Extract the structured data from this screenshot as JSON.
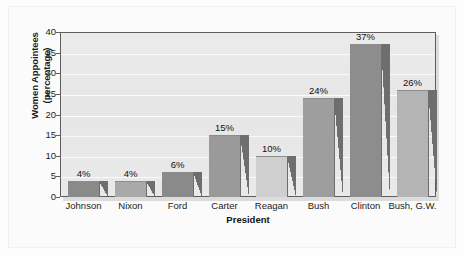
{
  "chart_data": {
    "type": "bar",
    "title": "",
    "xlabel": "President",
    "ylabel": "Women Appointees\n(percentage)",
    "ylabel_line1": "Women Appointees",
    "ylabel_line2": "(percentage)",
    "categories": [
      "Johnson",
      "Nixon",
      "Ford",
      "Carter",
      "Reagan",
      "Bush",
      "Clinton",
      "Bush, G.W."
    ],
    "values": [
      4,
      4,
      6,
      15,
      10,
      24,
      37,
      26
    ],
    "value_labels": [
      "4%",
      "4%",
      "6%",
      "15%",
      "10%",
      "24%",
      "37%",
      "26%"
    ],
    "bar_colors": [
      "#8a8a8a",
      "#a9a9a9",
      "#8a8a8a",
      "#9a9a9a",
      "#cfcfcf",
      "#9e9e9e",
      "#8d8d8d",
      "#b4b4b4"
    ],
    "ylim": [
      0,
      40
    ],
    "ytick_labels": [
      "0",
      "5",
      "10",
      "15",
      "20",
      "25",
      "30",
      "35",
      "40"
    ],
    "ytick_values": [
      0,
      5,
      10,
      15,
      20,
      25,
      30,
      35,
      40
    ],
    "grid": true,
    "grid_color": "#fafafa",
    "legend": "none",
    "plot_background": "#e8e8e8",
    "frame_color": "#5e5e5e",
    "text_color": "#1b1b1b"
  }
}
